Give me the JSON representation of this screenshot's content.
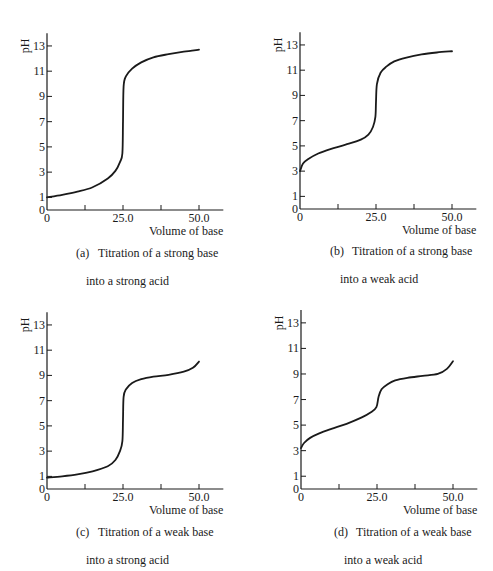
{
  "figure": {
    "panels": [
      {
        "id": "a",
        "letter": "(a)",
        "caption_line1": "Titration of a strong base",
        "caption_line2": "into a strong acid"
      },
      {
        "id": "b",
        "letter": "(b)",
        "caption_line1": "Titration of a strong base",
        "caption_line2": "into a weak acid"
      },
      {
        "id": "c",
        "letter": "(c)",
        "caption_line1": "Titration of a weak base",
        "caption_line2": "into a strong acid"
      },
      {
        "id": "d",
        "letter": "(d)",
        "caption_line1": "Titration of a weak base",
        "caption_line2": "into a weak acid"
      }
    ],
    "ylabel": "pH",
    "xlabel": "Volume of base",
    "y_ticks": [
      "0",
      "1",
      "3",
      "5",
      "7",
      "9",
      "11",
      "13"
    ],
    "x_tick_labels": [
      "0",
      "25.0",
      "50.0"
    ],
    "line_color": "#1a1a1a"
  },
  "chart_data": [
    {
      "type": "line",
      "title": "(a) Titration of a strong base into a strong acid",
      "xlabel": "Volume of base",
      "ylabel": "pH",
      "xlim": [
        0,
        58
      ],
      "ylim": [
        0,
        14
      ],
      "x_ticks": [
        0,
        12.5,
        25.0,
        37.5,
        50.0
      ],
      "y_ticks": [
        0,
        1,
        3,
        5,
        7,
        9,
        11,
        13
      ],
      "grid": false,
      "series": [
        {
          "name": "pH",
          "x": [
            0,
            5,
            10,
            15,
            20,
            22.5,
            24,
            24.8,
            25,
            25.2,
            26,
            28,
            31,
            35,
            40,
            45,
            50
          ],
          "y": [
            1.0,
            1.2,
            1.45,
            1.8,
            2.5,
            3.1,
            3.8,
            4.5,
            7.0,
            9.8,
            10.6,
            11.2,
            11.7,
            12.1,
            12.35,
            12.55,
            12.7
          ]
        }
      ]
    },
    {
      "type": "line",
      "title": "(b) Titration of a strong base into a weak acid",
      "xlabel": "Volume of base",
      "ylabel": "pH",
      "xlim": [
        0,
        58
      ],
      "ylim": [
        0,
        14
      ],
      "x_ticks": [
        0,
        12.5,
        25.0,
        37.5,
        50.0
      ],
      "y_ticks": [
        0,
        1,
        3,
        5,
        7,
        9,
        11,
        13
      ],
      "grid": false,
      "series": [
        {
          "name": "pH",
          "x": [
            0,
            1,
            3,
            6,
            10,
            15,
            20,
            22.5,
            24,
            24.8,
            25,
            25.3,
            26.5,
            28.5,
            31,
            35,
            40,
            45,
            50
          ],
          "y": [
            3.0,
            3.6,
            4.0,
            4.4,
            4.75,
            5.1,
            5.5,
            5.9,
            6.5,
            7.3,
            8.5,
            9.9,
            10.8,
            11.3,
            11.7,
            12.0,
            12.25,
            12.4,
            12.5
          ]
        }
      ]
    },
    {
      "type": "line",
      "title": "(c) Titration of a weak base into a strong acid",
      "xlabel": "Volume of base",
      "ylabel": "pH",
      "xlim": [
        0,
        58
      ],
      "ylim": [
        0,
        14
      ],
      "x_ticks": [
        0,
        12.5,
        25.0,
        37.5,
        50.0
      ],
      "y_ticks": [
        0,
        1,
        3,
        5,
        7,
        9,
        11,
        13
      ],
      "grid": false,
      "series": [
        {
          "name": "pH",
          "x": [
            0,
            5,
            10,
            15,
            20,
            22.5,
            24,
            24.8,
            25,
            25.2,
            26,
            28,
            31,
            35,
            40,
            45,
            48,
            50
          ],
          "y": [
            0.9,
            1.0,
            1.15,
            1.4,
            1.8,
            2.3,
            3.0,
            3.8,
            5.5,
            7.3,
            7.9,
            8.4,
            8.7,
            8.9,
            9.05,
            9.3,
            9.6,
            10.1
          ]
        }
      ]
    },
    {
      "type": "line",
      "title": "(d) Titration of a weak base into a weak acid",
      "xlabel": "Volume of base",
      "ylabel": "pH",
      "xlim": [
        0,
        58
      ],
      "ylim": [
        0,
        14
      ],
      "x_ticks": [
        0,
        12.5,
        25.0,
        37.5,
        50.0
      ],
      "y_ticks": [
        0,
        1,
        3,
        5,
        7,
        9,
        11,
        13
      ],
      "grid": false,
      "series": [
        {
          "name": "pH",
          "x": [
            0,
            1,
            3,
            6,
            10,
            15,
            20,
            23,
            24.8,
            25.5,
            26.5,
            28.5,
            31,
            35,
            40,
            45,
            48,
            50
          ],
          "y": [
            3.2,
            3.6,
            4.0,
            4.35,
            4.7,
            5.1,
            5.6,
            6.0,
            6.4,
            7.2,
            7.8,
            8.2,
            8.5,
            8.7,
            8.85,
            9.0,
            9.4,
            10.0
          ]
        }
      ]
    }
  ]
}
